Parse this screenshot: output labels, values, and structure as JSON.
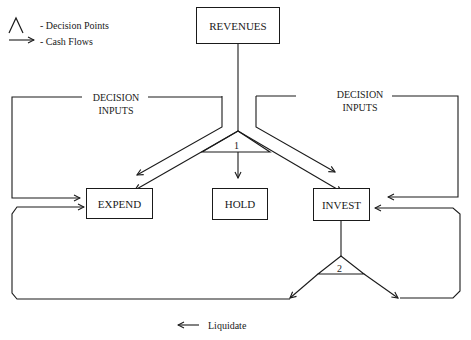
{
  "legend": {
    "decision_points_label": "- Decision Points",
    "cash_flows_label": "- Cash Flows",
    "decision_symbol": "⋀",
    "cash_flow_symbol": "⟶"
  },
  "nodes": {
    "revenues": "REVENUES",
    "expend": "EXPEND",
    "hold": "HOLD",
    "invest": "INVEST"
  },
  "decision_inputs": {
    "left_line1": "DECISION",
    "left_line2": "INPUTS",
    "right_line1": "DECISION",
    "right_line2": "INPUTS"
  },
  "decision_points": {
    "dp1": "1",
    "dp2": "2"
  },
  "footer": {
    "liquidate_arrow": "⟵",
    "liquidate_label": "Liquidate"
  }
}
